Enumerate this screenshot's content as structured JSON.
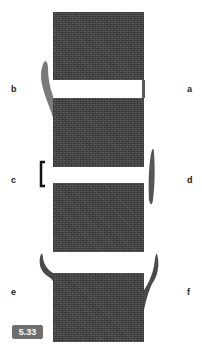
{
  "figure": {
    "number": "5.33",
    "panels": [
      {
        "label": "a",
        "description": "white gap with thin right-side band"
      },
      {
        "label": "b",
        "description": "curved tissue at left of gap"
      },
      {
        "label": "c",
        "description": "bracket at left of gap"
      },
      {
        "label": "d",
        "description": "elongated tissue at right of gap"
      },
      {
        "label": "e",
        "description": "curved hook at left of gap"
      },
      {
        "label": "f",
        "description": "curved hook at right of gap"
      }
    ]
  },
  "colors": {
    "block": "#3c3c3c",
    "tissue_light": "#7a7a7a",
    "tissue_dark": "#4a4a4a",
    "bracket": "#111111",
    "badge": "#6e6e6e"
  }
}
